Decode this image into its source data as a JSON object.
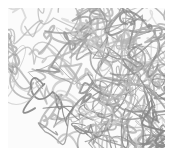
{
  "image": {
    "subject": "tangled gray fibers texture",
    "background_color": "#ffffff",
    "fiber_colors": [
      "#9a9a9a",
      "#b4b4b4",
      "#c8c8c8",
      "#888888"
    ]
  }
}
